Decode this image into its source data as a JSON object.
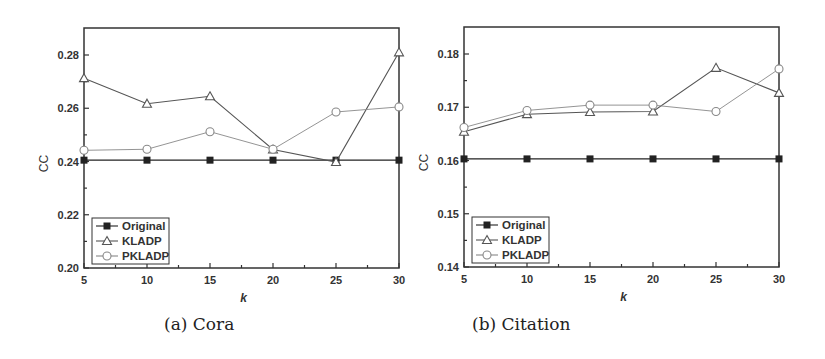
{
  "chart_data": [
    {
      "type": "line",
      "caption": "(a) Cora",
      "title": "",
      "xlabel": "k",
      "ylabel": "CC",
      "x": [
        5,
        10,
        15,
        20,
        25,
        30
      ],
      "xticks": [
        5,
        10,
        15,
        20,
        25,
        30
      ],
      "xlim": [
        5,
        30
      ],
      "ylim": [
        0.2,
        0.29
      ],
      "yticks": [
        0.2,
        0.22,
        0.24,
        0.26,
        0.28
      ],
      "ytick_labels": [
        "0.20",
        "0.22",
        "0.24",
        "0.26",
        "0.28"
      ],
      "grid": false,
      "legend_position": "lower left",
      "series": [
        {
          "name": "Original",
          "marker": "filled-square",
          "color": "#222222",
          "values": [
            0.2405,
            0.2405,
            0.2405,
            0.2405,
            0.2405,
            0.2405
          ]
        },
        {
          "name": "KLADP",
          "marker": "open-triangle",
          "color": "#555555",
          "values": [
            0.2713,
            0.2617,
            0.2645,
            0.2445,
            0.2398,
            0.281
          ]
        },
        {
          "name": "PKLADP",
          "marker": "open-circle",
          "color": "#888888",
          "values": [
            0.2442,
            0.2446,
            0.2512,
            0.2446,
            0.2586,
            0.2605
          ]
        }
      ]
    },
    {
      "type": "line",
      "caption": "(b) Citation",
      "title": "",
      "xlabel": "k",
      "ylabel": "CC",
      "x": [
        5,
        10,
        15,
        20,
        25,
        30
      ],
      "xticks": [
        5,
        10,
        15,
        20,
        25,
        30
      ],
      "xlim": [
        5,
        30
      ],
      "ylim": [
        0.14,
        0.185
      ],
      "yticks": [
        0.14,
        0.15,
        0.16,
        0.17,
        0.18
      ],
      "ytick_labels": [
        "0.14",
        "0.15",
        "0.16",
        "0.17",
        "0.18"
      ],
      "grid": false,
      "legend_position": "lower left",
      "series": [
        {
          "name": "Original",
          "marker": "filled-square",
          "color": "#222222",
          "values": [
            0.1603,
            0.1603,
            0.1603,
            0.1603,
            0.1603,
            0.1603
          ]
        },
        {
          "name": "KLADP",
          "marker": "open-triangle",
          "color": "#555555",
          "values": [
            0.1654,
            0.1687,
            0.1691,
            0.1692,
            0.1774,
            0.1727
          ]
        },
        {
          "name": "PKLADP",
          "marker": "open-circle",
          "color": "#888888",
          "values": [
            0.1662,
            0.1694,
            0.1704,
            0.1704,
            0.1692,
            0.1772
          ]
        }
      ]
    }
  ],
  "panels": {
    "a": {
      "caption": "(a) Cora"
    },
    "b": {
      "caption": "(b) Citation"
    }
  }
}
